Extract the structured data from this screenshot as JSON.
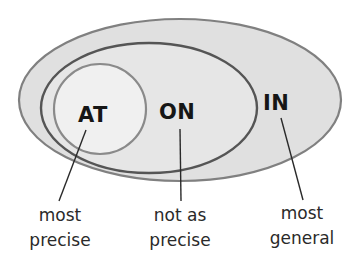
{
  "diagram": {
    "type": "nested-venn",
    "colors": {
      "background": "#ffffff",
      "outer_fill": "#e0e0e0",
      "middle_fill": "#e6e6e6",
      "inner_fill": "#f0f0f0",
      "outer_stroke": "#808080",
      "middle_stroke": "#555555",
      "inner_stroke": "#8a8a8a",
      "text": "#161616",
      "leader_line": "#2a2a2a"
    },
    "sets": [
      {
        "id": "in",
        "keyword": "IN",
        "caption_line1": "most",
        "caption_line2": "general"
      },
      {
        "id": "on",
        "keyword": "ON",
        "caption_line1": "not as",
        "caption_line2": "precise"
      },
      {
        "id": "at",
        "keyword": "AT",
        "caption_line1": "most",
        "caption_line2": "precise"
      }
    ]
  }
}
